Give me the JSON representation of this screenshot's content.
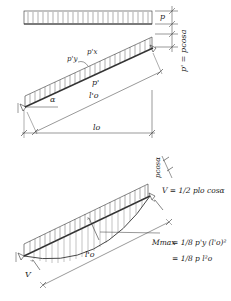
{
  "diagram": {
    "top_panel": {
      "horizontal_load_label": "p",
      "vertical_dim_label": "p' = pcosa",
      "decomposed_loads": {
        "p_y": "p'y",
        "p_x": "p'x"
      },
      "load_along_beam": "p'",
      "incline_angle": "α",
      "inclined_span": "l'o",
      "horizontal_span": "lo"
    },
    "bottom_panel": {
      "load_dim_label": "pcosα",
      "reaction_right": "V = 1/2 plo cosα",
      "reaction_left": "V",
      "inclined_span": "l'o",
      "moment_formula_line1_lhs": "Mmax",
      "moment_formula_line1_rhs": "= 1/8 p'y (l'o)²",
      "moment_formula_line2": "= 1/8 p l²o"
    },
    "colors": {
      "line": "#222222",
      "hatch": "#555555",
      "background": "#ffffff"
    }
  }
}
